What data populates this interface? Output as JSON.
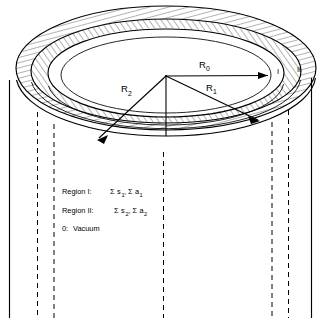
{
  "figure": {
    "type": "annular-cylinder-cross-section",
    "background_color": "#ffffff",
    "line_color": "#000000"
  },
  "radii": [
    {
      "id": "R0",
      "base": "R",
      "subscript": "0",
      "label": "R₀"
    },
    {
      "id": "R1",
      "base": "R",
      "subscript": "1",
      "label": "R₁"
    },
    {
      "id": "R2",
      "base": "R",
      "subscript": "2",
      "label": "R₂"
    }
  ],
  "region_markers": [
    {
      "id": "I",
      "label": "I"
    },
    {
      "id": "II",
      "label": "II"
    }
  ],
  "legend": {
    "items": [
      {
        "name": "Region I",
        "prefix": "Region I:",
        "terms": [
          {
            "sigma": "Σ",
            "base": "s",
            "subscript": "1"
          },
          {
            "sigma": "Σ",
            "base": "a",
            "subscript": "1"
          }
        ],
        "text": "Region I:  Σs₁,Σa₁"
      },
      {
        "name": "Region II",
        "prefix": "Region II:",
        "terms": [
          {
            "sigma": "Σ",
            "base": "s",
            "subscript": "2"
          },
          {
            "sigma": "Σ",
            "base": "a",
            "subscript": "2"
          }
        ],
        "text": "Region II:  Σs₂,Σa₂"
      },
      {
        "name": "Vacuum",
        "prefix": "0:",
        "terms": [],
        "text": "0:  Vacuum",
        "value": "Vacuum"
      }
    ]
  },
  "labels": {
    "region_i_prefix": "Region I:",
    "region_ii_prefix": "Region II:",
    "vacuum_prefix": "0:",
    "vacuum_value": "Vacuum",
    "sigma": "Σ",
    "s": "s",
    "a": "a",
    "one": "1",
    "two": "2",
    "zero": "0",
    "R": "R"
  }
}
